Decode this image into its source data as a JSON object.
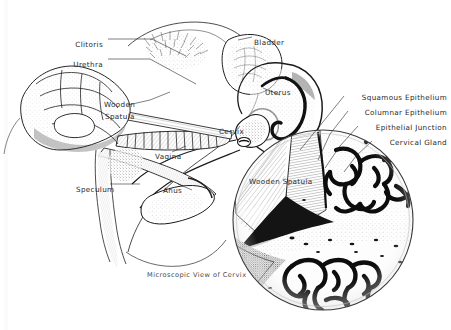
{
  "figure": {
    "caption": "Microscopic View of Cervix",
    "background_color": "#ffffff",
    "ink_color": "#1a1a1a",
    "label_color": "#2a2a2a"
  },
  "sagittal_labels": [
    {
      "id": "clitoris",
      "text": "Clitoris",
      "x": 103,
      "y": 41,
      "align": "right"
    },
    {
      "id": "urethra",
      "text": "Urethra",
      "x": 103,
      "y": 61,
      "align": "right"
    },
    {
      "id": "wooden-spatula",
      "text": "Wooden",
      "x": 104,
      "y": 101,
      "align": "left"
    },
    {
      "id": "wooden-spatula2",
      "text": "Spatula",
      "x": 105,
      "y": 113,
      "align": "left"
    },
    {
      "id": "bladder",
      "text": "Bladder",
      "x": 254,
      "y": 39,
      "align": "left"
    },
    {
      "id": "uterus",
      "text": "Uterus",
      "x": 265,
      "y": 89,
      "align": "left"
    },
    {
      "id": "cervix",
      "text": "Cervix",
      "x": 219,
      "y": 128,
      "align": "left"
    },
    {
      "id": "vagina",
      "text": "Vagina",
      "x": 155,
      "y": 153,
      "align": "left"
    },
    {
      "id": "speculum",
      "text": "Speculum",
      "x": 76,
      "y": 186,
      "align": "left"
    },
    {
      "id": "anus",
      "text": "Anus",
      "x": 163,
      "y": 187,
      "align": "left"
    }
  ],
  "inset_labels": [
    {
      "id": "squamous-epithelium",
      "text": "Squamous Epithelium",
      "x": 447,
      "y": 94,
      "align": "right"
    },
    {
      "id": "columnar-epithelium",
      "text": "Columnar Epithelium",
      "x": 447,
      "y": 109,
      "align": "right"
    },
    {
      "id": "epithelial-junction",
      "text": "Epithelial Junction",
      "x": 447,
      "y": 124,
      "align": "right"
    },
    {
      "id": "cervical-gland",
      "text": "Cervical Gland",
      "x": 447,
      "y": 139,
      "align": "right"
    },
    {
      "id": "inset-spatula",
      "text": "Wooden Spatula",
      "x": 249,
      "y": 178,
      "align": "left"
    }
  ],
  "inset": {
    "center_x": 323,
    "center_y": 220,
    "radius": 91,
    "caption_x": 147,
    "caption_y": 271
  }
}
